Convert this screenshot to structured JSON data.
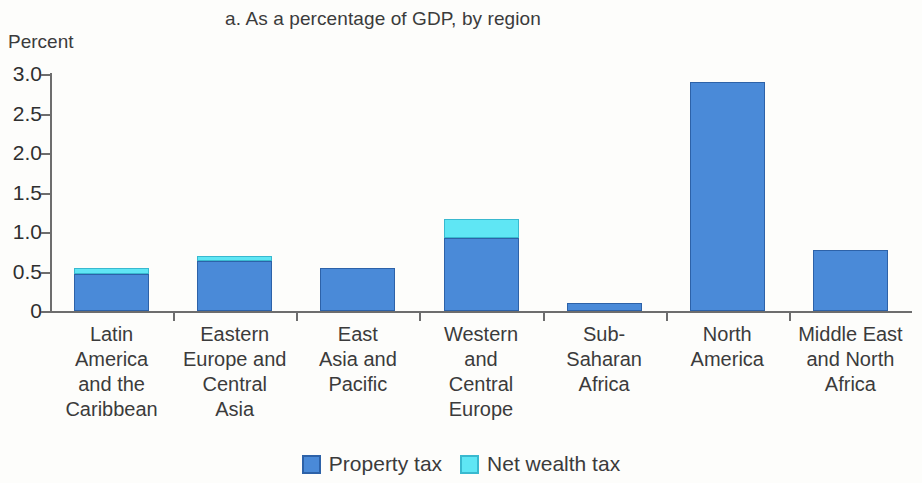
{
  "chart_data": {
    "type": "bar",
    "subtype": "stacked",
    "title": "a. As a percentage of GDP, by region",
    "ylabel": "Percent",
    "xlabel": "",
    "ylim": [
      0,
      3.0
    ],
    "yticks": [
      "3.0",
      "2.5",
      "2.0",
      "1.5",
      "1.0",
      "0.5",
      "0"
    ],
    "ytick_values": [
      3.0,
      2.5,
      2.0,
      1.5,
      1.0,
      0.5,
      0
    ],
    "grid": false,
    "legend_position": "bottom",
    "categories": [
      "Latin America and the Caribbean",
      "Eastern Europe and Central Asia",
      "East Asia and Pacific",
      "Western and Central Europe",
      "Sub-Saharan Africa",
      "North America",
      "Middle East and North Africa"
    ],
    "category_label_lines": [
      [
        "Latin",
        "America",
        "and the",
        "Caribbean"
      ],
      [
        "Eastern",
        "Europe and",
        "Central",
        "Asia"
      ],
      [
        "East",
        "Asia and",
        "Pacific"
      ],
      [
        "Western",
        "and",
        "Central",
        "Europe"
      ],
      [
        "Sub-",
        "Saharan",
        "Africa"
      ],
      [
        "North",
        "America"
      ],
      [
        "Middle East",
        "and North",
        "Africa"
      ]
    ],
    "series": [
      {
        "name": "Property tax",
        "color": "#4a8ad8",
        "values": [
          0.47,
          0.63,
          0.54,
          0.92,
          0.1,
          2.9,
          0.77
        ]
      },
      {
        "name": "Net wealth tax",
        "color": "#5fe6f4",
        "values": [
          0.07,
          0.07,
          0.0,
          0.24,
          0.0,
          0.0,
          0.0
        ]
      }
    ],
    "totals": [
      0.54,
      0.7,
      0.54,
      1.16,
      0.1,
      2.9,
      0.77
    ]
  },
  "legend": {
    "items": [
      {
        "label": "Property tax",
        "color": "#4a8ad8"
      },
      {
        "label": "Net wealth tax",
        "color": "#5fe6f4"
      }
    ]
  }
}
